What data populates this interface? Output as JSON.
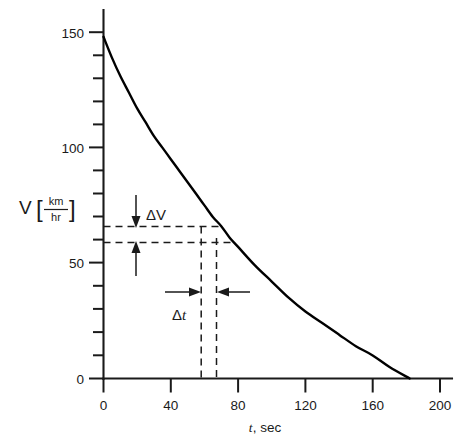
{
  "chart_data": {
    "type": "line",
    "title": "",
    "subtitle": "",
    "xlabel": "t, sec",
    "xlabel_symbol": "t",
    "xlabel_unit": ", sec",
    "ylabel": "V [km/hr]",
    "ylabel_symbol": "V",
    "ylabel_numerator": "km",
    "ylabel_denominator": "hr",
    "xlim": [
      0,
      200
    ],
    "ylim": [
      0,
      160
    ],
    "grid": false,
    "legend": null,
    "x_major_ticks": [
      0,
      40,
      80,
      120,
      160,
      200
    ],
    "x_tick_labels": [
      "0",
      "40",
      "80",
      "120",
      "160",
      "200"
    ],
    "y_major_ticks": [
      0,
      50,
      100,
      150
    ],
    "y_tick_labels": [
      "0",
      "50",
      "100",
      "150"
    ],
    "y_minor_tick_interval": 10,
    "series": [
      {
        "name": "V(t)",
        "x": [
          0,
          5,
          10,
          15,
          20,
          25,
          30,
          35,
          40,
          45,
          50,
          55,
          60,
          65,
          70,
          75,
          80,
          90,
          100,
          110,
          120,
          130,
          140,
          150,
          160,
          170,
          182
        ],
        "y": [
          148,
          139,
          131,
          124,
          117,
          111,
          105,
          100,
          95,
          90,
          85,
          80,
          75,
          70,
          66,
          61,
          57,
          49,
          42,
          35,
          29,
          24,
          19,
          14,
          10,
          5,
          0
        ]
      }
    ],
    "annotations": [
      {
        "name": "delta-v",
        "label": "ΔV",
        "type": "vertical-span",
        "y_upper": 66,
        "y_lower": 59,
        "x_label": 28,
        "description": "Change in velocity between two dashed horizontal guide lines"
      },
      {
        "name": "delta-t",
        "label": "Δt",
        "type": "horizontal-span",
        "x_left": 58,
        "x_right": 67,
        "y_label": 38,
        "description": "Change in time between two dashed vertical guide lines"
      }
    ],
    "guide_lines": {
      "horizontal": [
        66,
        59
      ],
      "vertical": [
        58,
        67
      ]
    },
    "curve_x_intercept": 182,
    "curve_y_intercept": 148,
    "colors": {
      "curve": "#000000",
      "axis": "#1a1a1a",
      "guide": "#1a1a1a",
      "background": "#ffffff"
    }
  },
  "figure": {
    "caption": "",
    "delta_v_label": "ΔV",
    "delta_t_symbol": "Δ",
    "delta_t_variable": "t"
  }
}
